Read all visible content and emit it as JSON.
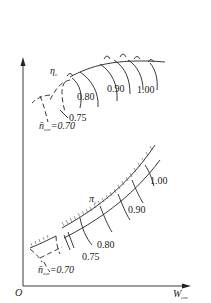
{
  "figure": {
    "axes": {
      "origin_label": "O",
      "x_label": "W",
      "x_label_sub": "cor",
      "y_label": ""
    },
    "efficiency_map": {
      "symbol": "η",
      "symbol_sub": "c",
      "speed_lines": [
        "0.75",
        "0.80",
        "0.90",
        "1.00"
      ],
      "min_speed_label": "n̄",
      "min_speed_sub": "cor",
      "min_speed_value": "=0.70"
    },
    "pressure_ratio_map": {
      "symbol": "π",
      "symbol_sub": "c",
      "speed_lines": [
        "0.75",
        "0.80",
        "0.90",
        "1.00"
      ],
      "min_speed_label": "n̄",
      "min_speed_sub": "cor",
      "min_speed_value": "=0.70"
    },
    "colors": {
      "line": "#222222",
      "background": "#ffffff"
    }
  }
}
